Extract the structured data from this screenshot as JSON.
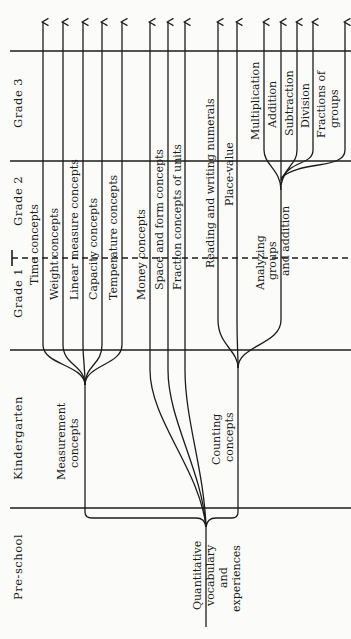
{
  "diagram": {
    "orientation": "rotated-90-ccw",
    "grades": [
      {
        "label": "Pre-school"
      },
      {
        "label": "Kindergarten"
      },
      {
        "label": "Grade 1"
      },
      {
        "label": "Grade 2"
      },
      {
        "label": "Grade 3"
      }
    ],
    "root": {
      "label_lines": [
        "Quantitative",
        "vocabulary",
        "and",
        "experiences"
      ]
    },
    "measurement": {
      "label_lines": [
        "Measurement",
        "concepts"
      ],
      "branches": [
        {
          "label": "Time concepts"
        },
        {
          "label": "Weight concepts"
        },
        {
          "label": "Linear measure concepts"
        },
        {
          "label": "Capacity concepts"
        },
        {
          "label": "Temperature concepts"
        }
      ]
    },
    "direct_branches": [
      {
        "label": "Money concepts"
      },
      {
        "label": "Space and form concepts"
      },
      {
        "label": "Fraction concepts of units"
      }
    ],
    "counting": {
      "label_lines": [
        "Counting",
        "concepts"
      ],
      "branches": [
        {
          "label": "Reading and writing numerals"
        },
        {
          "label": "Place-value"
        }
      ],
      "analyzing": {
        "label_lines": [
          "Analyzing",
          "groups",
          "and addition"
        ],
        "branches": [
          {
            "label": "Multiplication"
          },
          {
            "label": "Addition"
          },
          {
            "label": "Subtraction"
          },
          {
            "label": "Division"
          },
          {
            "label_lines": [
              "Fractions of",
              "groups"
            ]
          }
        ]
      }
    }
  }
}
